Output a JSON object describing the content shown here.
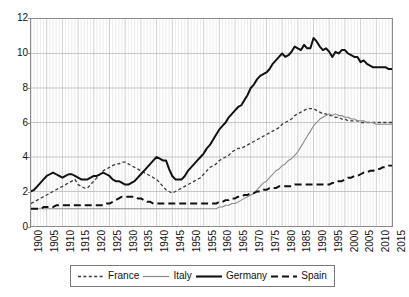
{
  "chart_data": {
    "type": "line",
    "title": "",
    "subtitle": "",
    "xlabel": "",
    "ylabel": "",
    "xlim": [
      1900,
      2015
    ],
    "ylim": [
      0,
      12
    ],
    "grid": "both-axes: horizontal every 2 units, vertical every 1 year",
    "legend_position": "below-plot-center",
    "y_ticks": [
      0,
      2,
      4,
      6,
      8,
      10,
      12
    ],
    "x_ticks": [
      1900,
      1905,
      1910,
      1915,
      1920,
      1925,
      1930,
      1935,
      1940,
      1945,
      1950,
      1955,
      1960,
      1965,
      1970,
      1975,
      1980,
      1985,
      1990,
      1995,
      2000,
      2005,
      2010,
      2015
    ],
    "x": [
      1900,
      1901,
      1902,
      1903,
      1904,
      1905,
      1906,
      1907,
      1908,
      1909,
      1910,
      1911,
      1912,
      1913,
      1914,
      1915,
      1916,
      1917,
      1918,
      1919,
      1920,
      1921,
      1922,
      1923,
      1924,
      1925,
      1926,
      1927,
      1928,
      1929,
      1930,
      1931,
      1932,
      1933,
      1934,
      1935,
      1936,
      1937,
      1938,
      1939,
      1940,
      1941,
      1942,
      1943,
      1944,
      1945,
      1946,
      1947,
      1948,
      1949,
      1950,
      1951,
      1952,
      1953,
      1954,
      1955,
      1956,
      1957,
      1958,
      1959,
      1960,
      1961,
      1962,
      1963,
      1964,
      1965,
      1966,
      1967,
      1968,
      1969,
      1970,
      1971,
      1972,
      1973,
      1974,
      1975,
      1976,
      1977,
      1978,
      1979,
      1980,
      1981,
      1982,
      1983,
      1984,
      1985,
      1986,
      1987,
      1988,
      1989,
      1990,
      1991,
      1992,
      1993,
      1994,
      1995,
      1996,
      1997,
      1998,
      1999,
      2000,
      2001,
      2002,
      2003,
      2004,
      2005,
      2006,
      2007,
      2008,
      2009,
      2010,
      2011,
      2012,
      2013,
      2014,
      2015
    ],
    "series": [
      {
        "name": "France",
        "style": "short-dashed",
        "color": "#3a3a3a",
        "width": 1.3,
        "values": [
          1.3,
          1.4,
          1.5,
          1.6,
          1.7,
          1.8,
          1.9,
          2.0,
          2.1,
          2.2,
          2.3,
          2.4,
          2.5,
          2.6,
          2.7,
          2.4,
          2.3,
          2.2,
          2.2,
          2.4,
          2.6,
          2.8,
          3.0,
          3.2,
          3.3,
          3.4,
          3.5,
          3.6,
          3.6,
          3.7,
          3.7,
          3.6,
          3.5,
          3.4,
          3.3,
          3.2,
          3.1,
          3.0,
          2.9,
          2.8,
          2.7,
          2.5,
          2.3,
          2.1,
          2.0,
          1.9,
          2.0,
          2.1,
          2.2,
          2.3,
          2.4,
          2.5,
          2.6,
          2.7,
          2.8,
          3.0,
          3.2,
          3.4,
          3.5,
          3.6,
          3.8,
          3.9,
          4.0,
          4.1,
          4.3,
          4.4,
          4.5,
          4.5,
          4.6,
          4.7,
          4.8,
          4.9,
          5.0,
          5.1,
          5.2,
          5.3,
          5.4,
          5.5,
          5.6,
          5.7,
          5.9,
          6.0,
          6.1,
          6.2,
          6.4,
          6.5,
          6.6,
          6.7,
          6.8,
          6.8,
          6.8,
          6.7,
          6.6,
          6.5,
          6.5,
          6.4,
          6.4,
          6.3,
          6.3,
          6.2,
          6.2,
          6.1,
          6.1,
          6.1,
          6.1,
          6.0,
          6.0,
          6.0,
          6.0,
          6.0,
          6.0,
          6.0,
          6.0,
          6.0,
          6.0,
          6.0
        ]
      },
      {
        "name": "Italy",
        "style": "solid-thin",
        "color": "#8a8a8a",
        "width": 1.1,
        "values": [
          1.0,
          1.0,
          1.0,
          1.0,
          1.0,
          1.0,
          1.0,
          1.0,
          1.0,
          1.0,
          1.0,
          1.0,
          1.0,
          1.0,
          1.0,
          1.0,
          1.0,
          1.0,
          1.0,
          1.0,
          1.0,
          1.0,
          1.0,
          1.0,
          1.0,
          1.0,
          1.0,
          1.0,
          1.0,
          1.0,
          1.0,
          1.0,
          1.0,
          1.0,
          1.0,
          1.0,
          1.0,
          1.0,
          1.0,
          1.0,
          1.0,
          1.0,
          1.0,
          1.0,
          1.0,
          1.0,
          1.0,
          1.0,
          1.0,
          1.0,
          1.0,
          1.0,
          1.0,
          1.0,
          1.0,
          1.0,
          1.0,
          1.0,
          1.0,
          1.0,
          1.1,
          1.1,
          1.2,
          1.2,
          1.3,
          1.3,
          1.4,
          1.5,
          1.6,
          1.7,
          1.8,
          1.9,
          2.1,
          2.3,
          2.5,
          2.6,
          2.8,
          3.0,
          3.2,
          3.3,
          3.5,
          3.6,
          3.8,
          3.9,
          4.1,
          4.3,
          4.6,
          4.9,
          5.2,
          5.5,
          5.8,
          6.0,
          6.2,
          6.3,
          6.4,
          6.5,
          6.4,
          6.5,
          6.4,
          6.4,
          6.3,
          6.3,
          6.2,
          6.2,
          6.1,
          6.1,
          6.1,
          6.0,
          6.0,
          6.0,
          5.9,
          5.9,
          5.9,
          5.9,
          5.9,
          5.9
        ]
      },
      {
        "name": "Germany",
        "style": "solid-thick",
        "color": "#111111",
        "width": 2.0,
        "values": [
          2.0,
          2.1,
          2.3,
          2.5,
          2.7,
          2.9,
          3.0,
          3.1,
          3.0,
          2.9,
          2.8,
          2.9,
          3.0,
          3.0,
          2.9,
          2.8,
          2.7,
          2.7,
          2.7,
          2.8,
          2.9,
          2.9,
          3.0,
          3.1,
          3.0,
          2.9,
          2.7,
          2.6,
          2.6,
          2.5,
          2.4,
          2.4,
          2.5,
          2.6,
          2.8,
          3.0,
          3.2,
          3.4,
          3.6,
          3.8,
          4.0,
          3.9,
          3.8,
          3.8,
          3.3,
          2.9,
          2.7,
          2.7,
          2.7,
          2.9,
          3.2,
          3.4,
          3.6,
          3.8,
          4.0,
          4.2,
          4.5,
          4.7,
          5.0,
          5.3,
          5.6,
          5.8,
          6.0,
          6.3,
          6.5,
          6.7,
          6.9,
          7.0,
          7.3,
          7.6,
          8.0,
          8.2,
          8.5,
          8.7,
          8.8,
          8.9,
          9.1,
          9.4,
          9.6,
          9.8,
          10.0,
          9.8,
          9.9,
          10.1,
          10.4,
          10.3,
          10.2,
          10.5,
          10.3,
          10.3,
          10.9,
          10.7,
          10.4,
          10.2,
          10.3,
          10.1,
          9.8,
          10.1,
          10.0,
          10.2,
          10.2,
          10.0,
          9.9,
          9.8,
          9.8,
          9.5,
          9.6,
          9.4,
          9.3,
          9.2,
          9.2,
          9.2,
          9.2,
          9.2,
          9.1,
          9.1
        ]
      },
      {
        "name": "Spain",
        "style": "long-dashed",
        "color": "#111111",
        "width": 2.0,
        "values": [
          1.0,
          1.0,
          1.0,
          1.0,
          1.1,
          1.1,
          1.1,
          1.1,
          1.2,
          1.2,
          1.2,
          1.2,
          1.2,
          1.2,
          1.2,
          1.2,
          1.2,
          1.2,
          1.2,
          1.2,
          1.2,
          1.2,
          1.2,
          1.2,
          1.3,
          1.3,
          1.4,
          1.5,
          1.6,
          1.7,
          1.7,
          1.7,
          1.7,
          1.7,
          1.6,
          1.6,
          1.5,
          1.4,
          1.4,
          1.3,
          1.3,
          1.3,
          1.3,
          1.3,
          1.3,
          1.3,
          1.3,
          1.3,
          1.3,
          1.3,
          1.3,
          1.3,
          1.3,
          1.3,
          1.3,
          1.3,
          1.3,
          1.3,
          1.3,
          1.3,
          1.4,
          1.4,
          1.5,
          1.5,
          1.6,
          1.6,
          1.7,
          1.7,
          1.8,
          1.8,
          1.9,
          1.9,
          2.0,
          2.0,
          2.1,
          2.1,
          2.2,
          2.2,
          2.2,
          2.3,
          2.3,
          2.3,
          2.3,
          2.3,
          2.4,
          2.4,
          2.4,
          2.4,
          2.4,
          2.4,
          2.4,
          2.4,
          2.4,
          2.4,
          2.4,
          2.4,
          2.5,
          2.5,
          2.6,
          2.6,
          2.7,
          2.8,
          2.8,
          2.9,
          2.9,
          3.0,
          3.1,
          3.1,
          3.2,
          3.2,
          3.3,
          3.3,
          3.4,
          3.4,
          3.5,
          3.5
        ]
      }
    ]
  },
  "legend": {
    "items": [
      {
        "label": "France"
      },
      {
        "label": "Italy"
      },
      {
        "label": "Germany"
      },
      {
        "label": "Spain"
      }
    ]
  },
  "colors": {
    "france": "#3a3a3a",
    "italy": "#8a8a8a",
    "germany": "#111111",
    "spain": "#111111",
    "grid_major": "#b9b9b9",
    "grid_minor": "#dcdcdc",
    "frame": "#8c8c8c",
    "background": "#ffffff"
  }
}
